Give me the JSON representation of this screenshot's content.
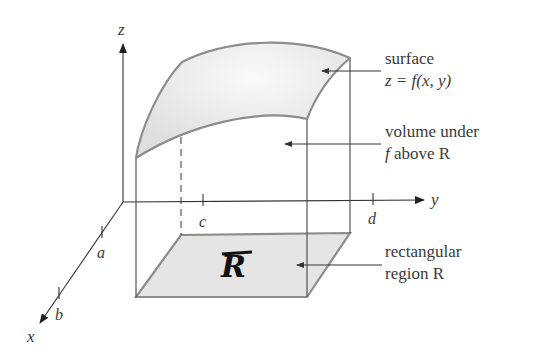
{
  "figure": {
    "axes": {
      "x_label": "x",
      "y_label": "y",
      "z_label": "z"
    },
    "ticks": {
      "a": "a",
      "b": "b",
      "c": "c",
      "d": "d"
    },
    "annotations": {
      "surface_line1": "surface",
      "surface_line2": "z = f(x, y)",
      "volume_line1": "volume under",
      "volume_line2_f": "f",
      "volume_line2_rest": " above R",
      "region_line1": "rectangular",
      "region_line2": "region R"
    },
    "region_symbol": "R",
    "colors": {
      "axis": "#333333",
      "surface_fill": "#e6e6e6",
      "surface_highlight": "#f8f8f8",
      "surface_edge": "#8c8c8c",
      "region_fill": "#e4e4e4",
      "region_edge": "#8c8c8c",
      "text": "#3a3a3a"
    }
  }
}
